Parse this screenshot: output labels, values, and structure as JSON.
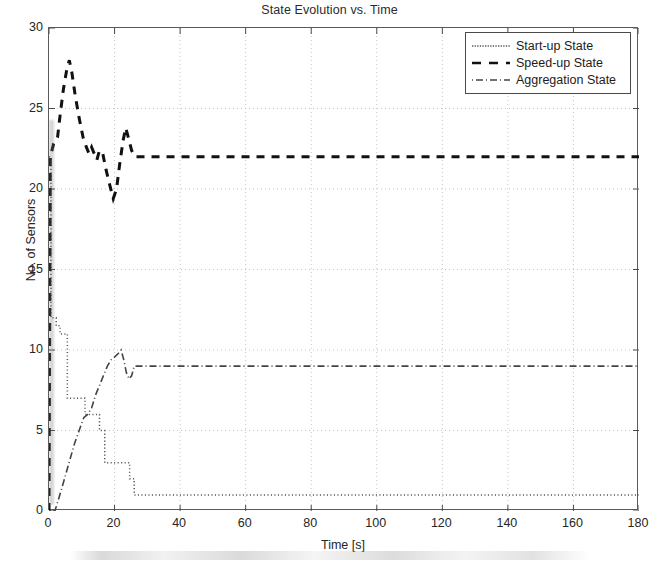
{
  "chart_data": {
    "type": "line",
    "title": "State Evolution vs. Time",
    "xlabel": "Time [s]",
    "ylabel": "No. of Sensors",
    "xlim": [
      0,
      180
    ],
    "ylim": [
      0,
      30
    ],
    "xticks": [
      0,
      20,
      40,
      60,
      80,
      100,
      120,
      140,
      160,
      180
    ],
    "yticks": [
      0,
      5,
      10,
      15,
      20,
      25,
      30
    ],
    "grid": true,
    "grid_style": "dotted",
    "legend_position": "top-right",
    "series": [
      {
        "name": "Start-up State",
        "style": "dotted",
        "color": "#555555",
        "x": [
          0,
          0.6,
          0.6,
          2.2,
          2.2,
          3.4,
          3.4,
          5.6,
          5.6,
          8.4,
          8.4,
          11.0,
          11.0,
          13.8,
          13.8,
          15.4,
          15.4,
          17.0,
          17.0,
          22.0,
          22.0,
          24.6,
          24.6,
          26.0,
          26.0,
          180
        ],
        "y": [
          22,
          22,
          12,
          12,
          11.5,
          11.5,
          11,
          11,
          7,
          7,
          7,
          7,
          6,
          6,
          6,
          6,
          5,
          5,
          3,
          3,
          3,
          3,
          2,
          2,
          1,
          1
        ]
      },
      {
        "name": "Speed-up State",
        "style": "dashed",
        "color": "#111111",
        "x": [
          0,
          0.4,
          1.4,
          2.6,
          3.4,
          4.4,
          5.4,
          6.2,
          7.0,
          8.0,
          9.2,
          10.4,
          11.4,
          12.2,
          13.0,
          13.8,
          14.6,
          15.4,
          16.4,
          17.4,
          18.6,
          19.6,
          20.6,
          21.6,
          22.6,
          23.4,
          24.2,
          25.2,
          26.2,
          27.2,
          180
        ],
        "y": [
          0,
          22,
          22.8,
          23.2,
          24.6,
          26.2,
          27.4,
          28,
          27.2,
          25.8,
          24.4,
          23.2,
          22.6,
          22.2,
          22.6,
          22.2,
          21.8,
          22.4,
          22.2,
          21.2,
          20.2,
          19.4,
          20.0,
          21.6,
          23.0,
          23.8,
          23.2,
          22.4,
          22.0,
          22,
          22
        ]
      },
      {
        "name": "Aggregation State",
        "style": "dashdot",
        "color": "#444444",
        "x": [
          0,
          1.8,
          3.6,
          5.0,
          6.4,
          7.8,
          9.2,
          10.6,
          11.8,
          13.0,
          14.2,
          15.4,
          16.6,
          17.8,
          19.0,
          20.2,
          21.2,
          22.0,
          22.8,
          23.6,
          24.4,
          25.2,
          26.0,
          27.0,
          28.2,
          180
        ],
        "y": [
          0,
          0,
          1.2,
          2.2,
          3.2,
          4.2,
          5.0,
          5.8,
          6.0,
          6.4,
          7.2,
          7.8,
          8.4,
          9.0,
          9.4,
          9.6,
          9.8,
          10.0,
          9.4,
          8.6,
          8.2,
          8.4,
          9.0,
          9.0,
          9.0,
          9.0
        ]
      }
    ]
  },
  "legend": {
    "items": [
      {
        "label": "Start-up State"
      },
      {
        "label": "Speed-up State"
      },
      {
        "label": "Aggregation State"
      }
    ]
  }
}
